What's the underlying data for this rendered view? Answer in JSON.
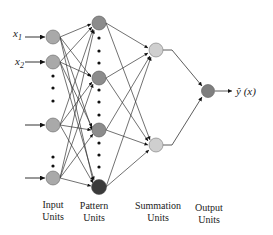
{
  "diagram": {
    "type": "neural-network",
    "colors": {
      "input_node": "#a9a9a9",
      "pattern_node": "#8c8c8c",
      "pattern_node_last": "#3a3a3a",
      "summation_node": "#cfcfcf",
      "output_node": "#7f7f7f",
      "edge": "#333333",
      "dot": "#111111"
    },
    "inputs": {
      "x1_label": "x",
      "x1_sub": "1",
      "x2_label": "x",
      "x2_sub": "2"
    },
    "output": {
      "label": "ŷ (x)"
    },
    "layers": [
      {
        "name": "input",
        "caption_line1": "Input",
        "caption_line2": "Units"
      },
      {
        "name": "pattern",
        "caption_line1": "Pattern",
        "caption_line2": "Units"
      },
      {
        "name": "summation",
        "caption_line1": "Summation",
        "caption_line2": "Units"
      },
      {
        "name": "output",
        "caption_line1": "Output",
        "caption_line2": "Units"
      }
    ]
  }
}
